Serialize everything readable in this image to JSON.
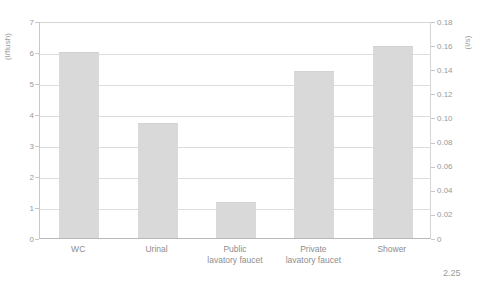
{
  "figure": {
    "number_label": "2.25"
  },
  "chart_data": {
    "type": "bar",
    "title": "",
    "categories": [
      "WC",
      "Urinal",
      "Public\nlavatory faucet",
      "Private\nlavatory faucet",
      "Shower"
    ],
    "values": [
      6.0,
      3.7,
      1.15,
      5.4,
      6.2
    ],
    "xlabel": "",
    "ylabel": "(l/flush)",
    "ylabel_right": "(l/s)",
    "ylim": [
      0,
      7
    ],
    "yticks": [
      "0",
      "1",
      "2",
      "3",
      "4",
      "5",
      "6",
      "7"
    ],
    "ylim_right": [
      0,
      0.18
    ],
    "yticks_right": [
      "0",
      "0.02",
      "0.04",
      "0.06",
      "0.08",
      "0.10",
      "0.12",
      "0.14",
      "0.16",
      "0.18"
    ],
    "grid": true,
    "legend": "none",
    "bar_color": "#d9d9d9",
    "axis_color": "#c9c9c9",
    "grid_color": "#dcdcdc",
    "text_color": "#9a9a9a"
  }
}
